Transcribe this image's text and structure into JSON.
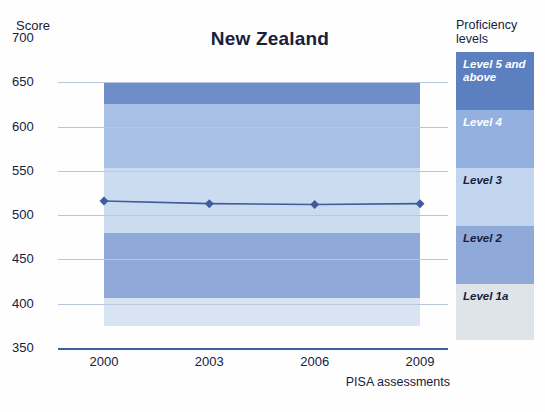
{
  "chart_data": {
    "type": "area",
    "title": "New Zealand",
    "xlabel": "PISA assessments",
    "ylabel": "Score",
    "categories": [
      "2000",
      "2003",
      "2006",
      "2009"
    ],
    "x_tick_labels": [
      "2000",
      "2003",
      "2006",
      "2009"
    ],
    "y_tick_labels": [
      "700",
      "650",
      "600",
      "550",
      "500",
      "450",
      "400",
      "350"
    ],
    "y_tick_values": [
      700,
      650,
      600,
      550,
      500,
      450,
      400,
      350
    ],
    "ylim": [
      350,
      700
    ],
    "grid": true,
    "legend_position": "right",
    "legend_title": "Proficiency levels",
    "series": [
      {
        "name": "Mean score",
        "type": "line",
        "values": [
          516,
          513,
          512,
          513
        ],
        "color": "#3f5c9c",
        "marker": "diamond"
      }
    ],
    "bands": [
      {
        "label": "Level 5 and above",
        "from": 626,
        "to": 650,
        "color": "#6f8dc9",
        "legend_color": "#5c7fc0"
      },
      {
        "label": "Level 4",
        "from": 553,
        "to": 626,
        "color": "#a8c0e4",
        "legend_color": "#93b0de"
      },
      {
        "label": "Level 3",
        "from": 480,
        "to": 553,
        "color": "#ccdcf0",
        "legend_color": "#c2d5ee"
      },
      {
        "label": "Level 2",
        "from": 407,
        "to": 480,
        "color": "#8faad8",
        "legend_color": "#8faad8"
      },
      {
        "label": "Level 1a",
        "from": 375,
        "to": 407,
        "color": "#d8e4f2",
        "legend_color": "#dfe4e8"
      }
    ],
    "band_x_from": "2000",
    "band_x_to": "2009"
  },
  "legend": {
    "title_line1": "Proficiency",
    "title_line2": "levels",
    "items": [
      {
        "label": "Level 5 and above",
        "color": "#5c7fc0",
        "text_color": "#ffffff"
      },
      {
        "label": "Level 4",
        "color": "#93b0de",
        "text_color": "#ffffff"
      },
      {
        "label": "Level 3",
        "color": "#c2d5ee",
        "text_color": "#16213e"
      },
      {
        "label": "Level 2",
        "color": "#8faad8",
        "text_color": "#16213e"
      },
      {
        "label": "Level 1a",
        "color": "#dfe4e8",
        "text_color": "#16213e"
      }
    ]
  }
}
